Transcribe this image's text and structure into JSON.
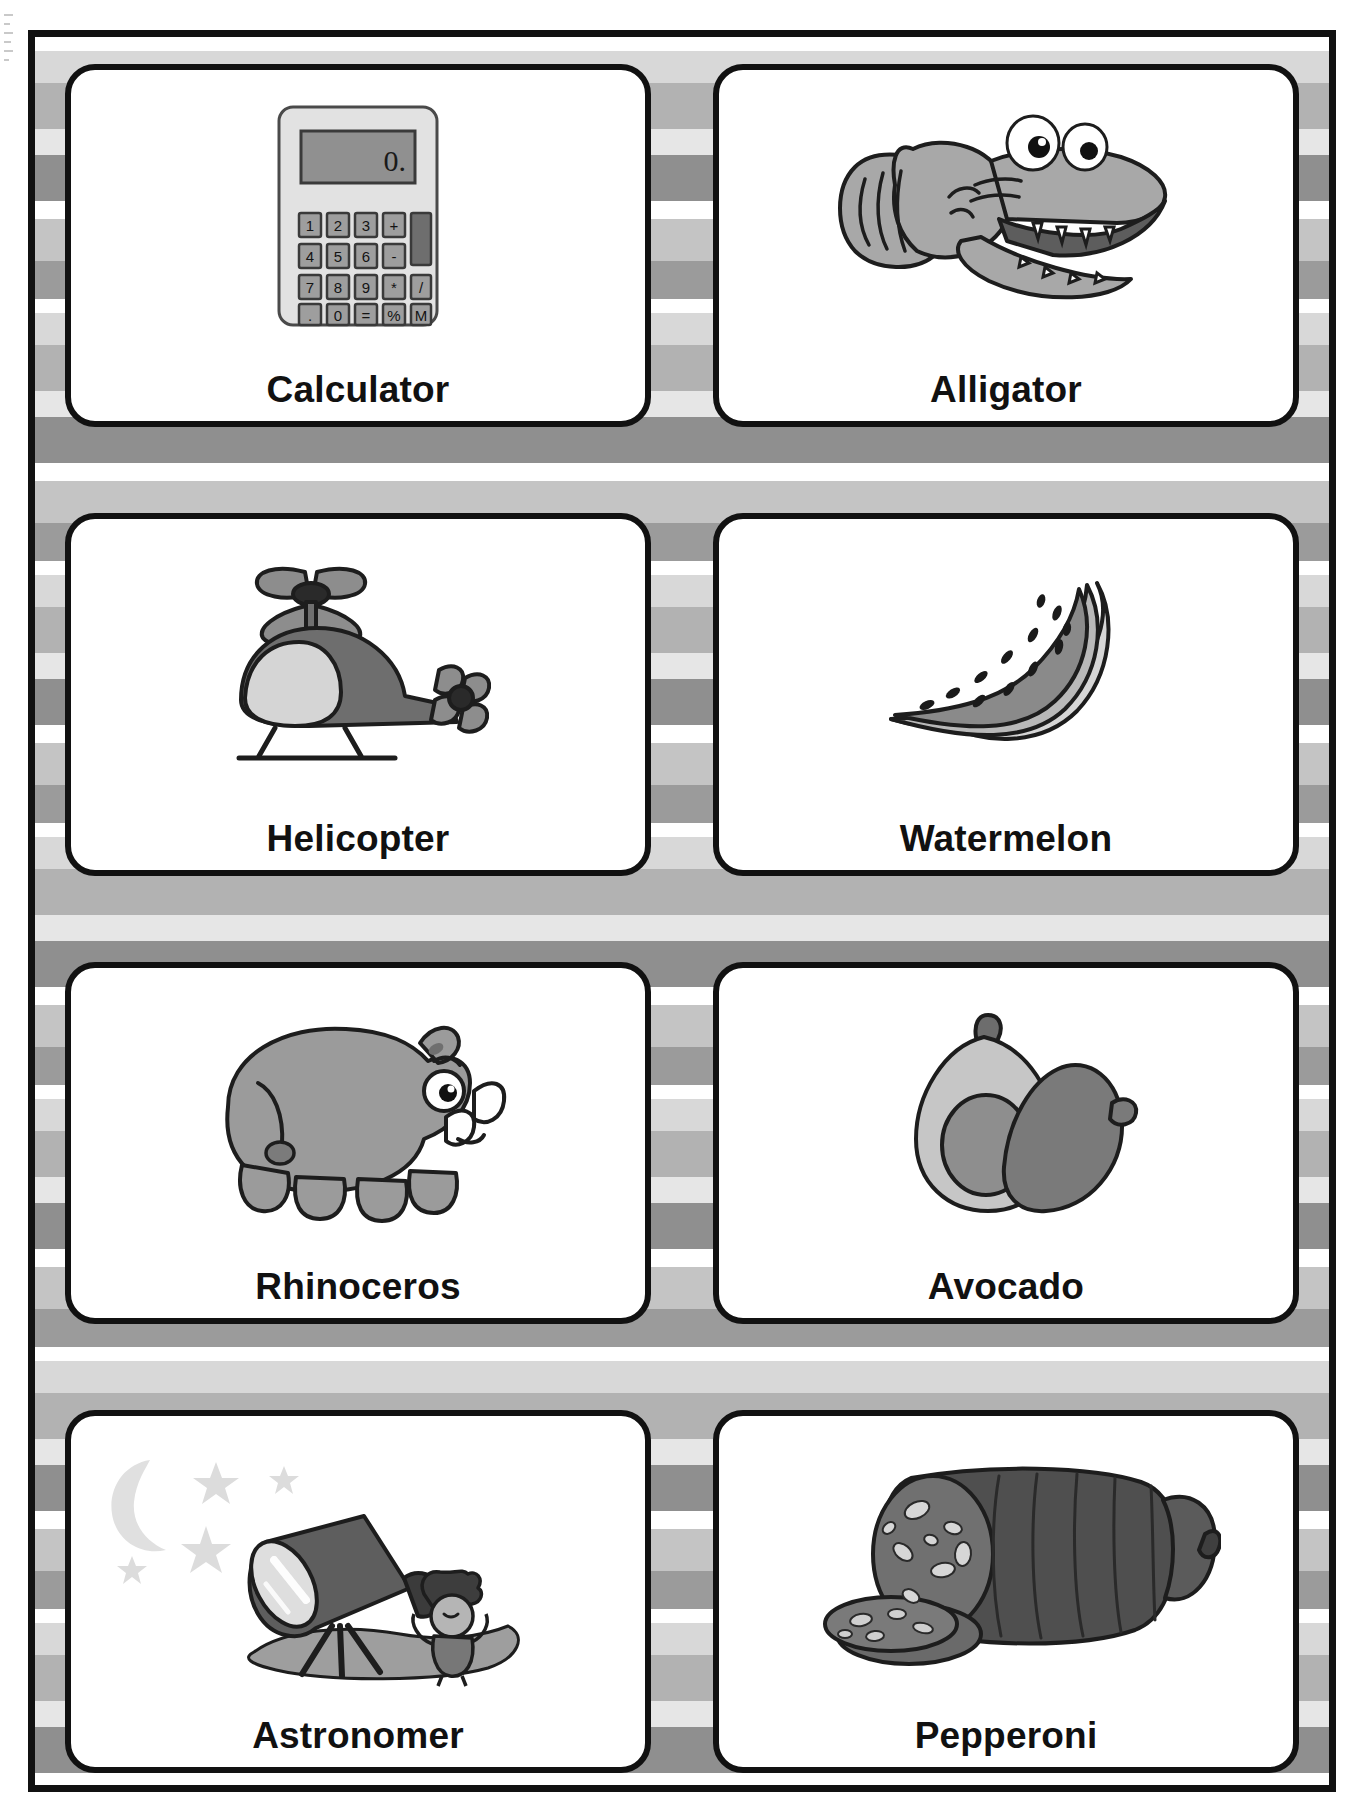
{
  "page": {
    "columns": 2,
    "rows": 4
  },
  "cards": [
    {
      "label": "Calculator",
      "icon": "calculator-icon"
    },
    {
      "label": "Alligator",
      "icon": "alligator-icon"
    },
    {
      "label": "Helicopter",
      "icon": "helicopter-icon"
    },
    {
      "label": "Watermelon",
      "icon": "watermelon-icon"
    },
    {
      "label": "Rhinoceros",
      "icon": "rhinoceros-icon"
    },
    {
      "label": "Avocado",
      "icon": "avocado-icon"
    },
    {
      "label": "Astronomer",
      "icon": "astronomer-icon"
    },
    {
      "label": "Pepperoni",
      "icon": "pepperoni-icon"
    }
  ],
  "calculator": {
    "display_value": "0.",
    "keys": [
      [
        "1",
        "2",
        "3",
        "+"
      ],
      [
        "4",
        "5",
        "6",
        "-"
      ],
      [
        "7",
        "8",
        "9",
        "*",
        "/"
      ],
      [
        ".",
        "0",
        "=",
        "%",
        "M"
      ]
    ]
  },
  "colors": {
    "ink": "#111111",
    "card_background": "#ffffff",
    "stripe_white": "#ffffff",
    "stripe_light": "#d8d8d8",
    "stripe_mid": "#b2b2b2",
    "stripe_pale": "#e6e6e6",
    "stripe_dark": "#8f8f8f",
    "art_light": "#d3d3d3",
    "art_mid": "#a0a0a0",
    "art_dark": "#6e6e6e",
    "art_darkest": "#4a4a4a"
  }
}
